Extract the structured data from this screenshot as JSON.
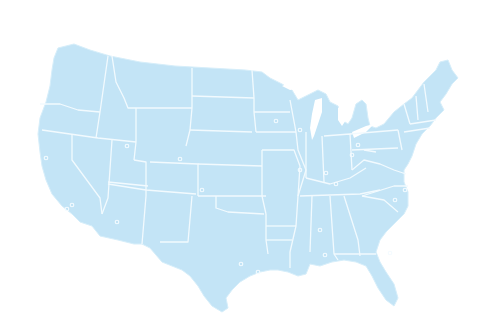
{
  "map": {
    "title": "",
    "region": "Contiguous United States",
    "style": "outline map with state borders",
    "colors": {
      "land": "#c3e4f6",
      "borders": "#f2fafe",
      "background": "#ffffff",
      "city_markers": "#f4fbff"
    },
    "labels": [],
    "city_markers": [
      {
        "x": 46,
        "y": 158
      },
      {
        "x": 72,
        "y": 205
      },
      {
        "x": 67,
        "y": 209
      },
      {
        "x": 117,
        "y": 222
      },
      {
        "x": 127,
        "y": 146
      },
      {
        "x": 180,
        "y": 159
      },
      {
        "x": 202,
        "y": 190
      },
      {
        "x": 241,
        "y": 264
      },
      {
        "x": 258,
        "y": 272
      },
      {
        "x": 276,
        "y": 121
      },
      {
        "x": 300,
        "y": 130
      },
      {
        "x": 300,
        "y": 170
      },
      {
        "x": 320,
        "y": 230
      },
      {
        "x": 325,
        "y": 255
      },
      {
        "x": 326,
        "y": 173
      },
      {
        "x": 336,
        "y": 184
      },
      {
        "x": 352,
        "y": 155
      },
      {
        "x": 358,
        "y": 145
      },
      {
        "x": 395,
        "y": 200
      },
      {
        "x": 405,
        "y": 190
      },
      {
        "x": 390,
        "y": 253
      }
    ]
  }
}
